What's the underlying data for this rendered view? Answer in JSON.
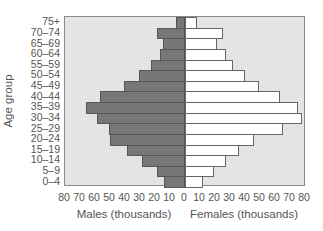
{
  "chart_data": {
    "type": "bar",
    "subtype": "population-pyramid",
    "title": "",
    "ylabel": "Age group",
    "xlabel_left": "Males (thousands)",
    "xlabel_right": "Females (thousands)",
    "xlim": [
      80,
      80
    ],
    "x_ticks": [
      "80",
      "70",
      "60",
      "50",
      "40",
      "30",
      "20",
      "10",
      "0",
      "10",
      "20",
      "30",
      "40",
      "50",
      "60",
      "70",
      "80"
    ],
    "grid": false,
    "legend": null,
    "categories": [
      "75+",
      "70–74",
      "65–69",
      "60–64",
      "55–59",
      "50–54",
      "45–49",
      "40–44",
      "35–39",
      "30–34",
      "25–29",
      "20–24",
      "15–19",
      "10–14",
      "5–9",
      "0–4"
    ],
    "series": [
      {
        "name": "Males",
        "color": "#777777",
        "values": [
          6,
          19,
          15,
          17,
          23,
          31,
          41,
          57,
          66,
          59,
          51,
          50,
          39,
          29,
          19,
          14
        ]
      },
      {
        "name": "Females",
        "color": "#ffffff",
        "values": [
          8,
          25,
          21,
          27,
          32,
          40,
          49,
          63,
          75,
          78,
          65,
          46,
          36,
          27,
          19,
          12
        ]
      }
    ],
    "colors": {
      "plot_background": "#e4e4e4",
      "frame": "#8a8a8a"
    }
  }
}
